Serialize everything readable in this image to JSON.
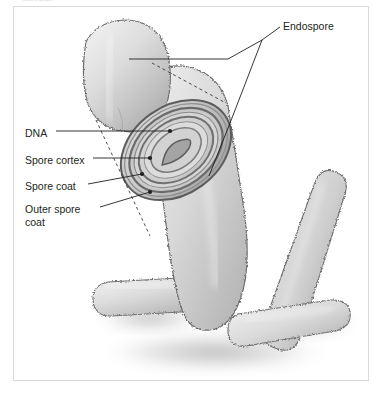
{
  "figure": {
    "title_credit": "Illustration",
    "background_color": "#ffffff",
    "frame_color": "#d9d9d9",
    "ink_color": "#231f20"
  },
  "labels": {
    "endospore": "Endospore",
    "dna": "DNA",
    "spore_cortex": "Spore cortex",
    "spore_coat": "Spore coat",
    "outer_spore_coat": "Outer spore coat"
  },
  "diagram": {
    "cell_shape": "rod",
    "cell_count": 4,
    "palette": {
      "cell_light": "#e2e2e2",
      "cell_mid": "#c4c4c4",
      "cell_dark": "#9a9a9a",
      "outline": "#6e6e6e",
      "shadow": "#bdbdbd",
      "core_light": "#dedede",
      "band_dark": "#7e7e7e"
    },
    "layers": [
      {
        "name": "DNA",
        "order": 1
      },
      {
        "name": "Spore cortex",
        "order": 2
      },
      {
        "name": "Spore coat",
        "order": 3
      },
      {
        "name": "Outer spore coat",
        "order": 4
      }
    ]
  }
}
